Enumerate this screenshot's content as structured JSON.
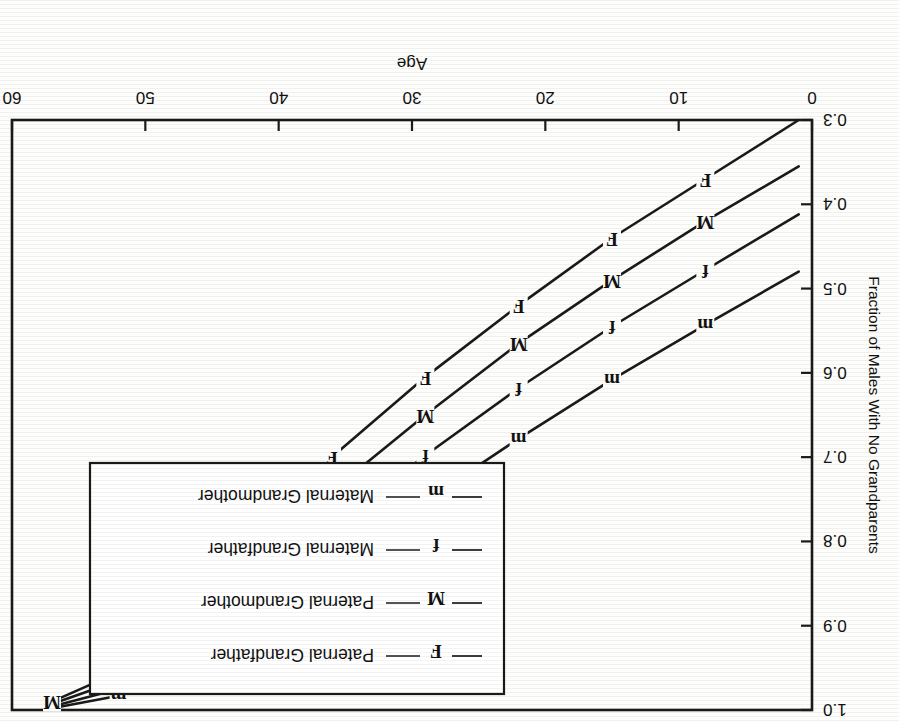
{
  "chart_data": {
    "type": "line",
    "title": "",
    "xlabel": "Age",
    "ylabel": "Fraction of Males With No Grandparents",
    "xlim": [
      0,
      60
    ],
    "ylim": [
      0.3,
      1.0
    ],
    "xticks": [
      0,
      10,
      20,
      30,
      40,
      50,
      60
    ],
    "xticklabels": [
      "0",
      "10",
      "20",
      "30",
      "40",
      "50",
      "60"
    ],
    "yticks": [
      0.3,
      0.4,
      0.5,
      0.6,
      0.7,
      0.8,
      0.9,
      1.0
    ],
    "yticklabels": [
      "0.3",
      "0.4",
      "0.5",
      "0.6",
      "0.7",
      "0.8",
      "0.9",
      "1.0"
    ],
    "grid": false,
    "legend_position": "upper right",
    "series": [
      {
        "name": "Paternal Grandfather",
        "marker": "F",
        "x": [
          1,
          8,
          15,
          22,
          29,
          36,
          41,
          45,
          48,
          52,
          57
        ],
        "y": [
          0.3,
          0.37,
          0.44,
          0.52,
          0.605,
          0.7,
          0.775,
          0.845,
          0.9,
          0.955,
          0.99
        ]
      },
      {
        "name": "Paternal Grandmother",
        "marker": "M",
        "x": [
          1,
          8,
          15,
          22,
          29,
          36,
          41,
          45,
          48,
          52,
          57
        ],
        "y": [
          0.355,
          0.42,
          0.49,
          0.565,
          0.65,
          0.74,
          0.812,
          0.875,
          0.922,
          0.965,
          0.993
        ]
      },
      {
        "name": "Maternal Grandfather",
        "marker": "f",
        "x": [
          1,
          8,
          15,
          22,
          29,
          36,
          41,
          45,
          48,
          52,
          57
        ],
        "y": [
          0.412,
          0.478,
          0.545,
          0.618,
          0.698,
          0.783,
          0.848,
          0.902,
          0.94,
          0.975,
          0.996
        ]
      },
      {
        "name": "Maternal Grandmother",
        "marker": "m",
        "x": [
          1,
          8,
          15,
          22,
          29,
          36,
          41,
          45,
          48,
          52,
          57
        ],
        "y": [
          0.48,
          0.543,
          0.608,
          0.678,
          0.752,
          0.828,
          0.885,
          0.928,
          0.957,
          0.983,
          0.998
        ]
      }
    ],
    "marker_points": {
      "Paternal Grandfather": [
        {
          "x": 8,
          "y": 0.37
        },
        {
          "x": 15,
          "y": 0.44
        },
        {
          "x": 22,
          "y": 0.52
        },
        {
          "x": 29,
          "y": 0.605
        },
        {
          "x": 36,
          "y": 0.7
        },
        {
          "x": 41,
          "y": 0.775
        },
        {
          "x": 45,
          "y": 0.845
        },
        {
          "x": 48,
          "y": 0.9
        }
      ],
      "Paternal Grandmother": [
        {
          "x": 8,
          "y": 0.42
        },
        {
          "x": 15,
          "y": 0.49
        },
        {
          "x": 22,
          "y": 0.565
        },
        {
          "x": 29,
          "y": 0.65
        },
        {
          "x": 36,
          "y": 0.74
        },
        {
          "x": 41,
          "y": 0.812
        },
        {
          "x": 45,
          "y": 0.875
        },
        {
          "x": 48,
          "y": 0.922
        },
        {
          "x": 52,
          "y": 0.965
        },
        {
          "x": 57,
          "y": 0.99
        }
      ],
      "Maternal Grandfather": [
        {
          "x": 8,
          "y": 0.478
        },
        {
          "x": 15,
          "y": 0.545
        },
        {
          "x": 22,
          "y": 0.618
        },
        {
          "x": 29,
          "y": 0.698
        },
        {
          "x": 36,
          "y": 0.783
        },
        {
          "x": 41,
          "y": 0.848
        },
        {
          "x": 45,
          "y": 0.902
        },
        {
          "x": 48,
          "y": 0.94
        }
      ],
      "Maternal Grandmother": [
        {
          "x": 8,
          "y": 0.543
        },
        {
          "x": 15,
          "y": 0.608
        },
        {
          "x": 22,
          "y": 0.678
        },
        {
          "x": 29,
          "y": 0.752
        },
        {
          "x": 36,
          "y": 0.828
        },
        {
          "x": 41,
          "y": 0.885
        },
        {
          "x": 45,
          "y": 0.928
        },
        {
          "x": 48,
          "y": 0.957
        },
        {
          "x": 52,
          "y": 0.983
        }
      ]
    }
  },
  "legend": {
    "entries": [
      {
        "marker": "F",
        "label": "Paternal Grandfather"
      },
      {
        "marker": "M",
        "label": "Paternal Grandmother"
      },
      {
        "marker": "f",
        "label": "Maternal Grandfather"
      },
      {
        "marker": "m",
        "label": "Maternal Grandmother"
      }
    ]
  },
  "axis": {
    "x_title": "Age",
    "y_title": "Fraction of Males With No Grandparents"
  }
}
